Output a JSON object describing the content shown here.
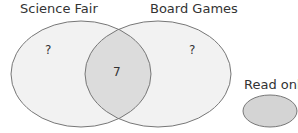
{
  "venn": {
    "sets": [
      {
        "label": "Science Fair",
        "only_value": "?"
      },
      {
        "label": "Board Games",
        "only_value": "?"
      }
    ],
    "intersection_value": "7"
  },
  "legend": {
    "label": "Read only",
    "swatch_color": "#d4d4d4"
  },
  "colors": {
    "set_fill": "#f2f2f2",
    "intersection_fill": "#dcdcdc",
    "stroke": "#777777"
  }
}
